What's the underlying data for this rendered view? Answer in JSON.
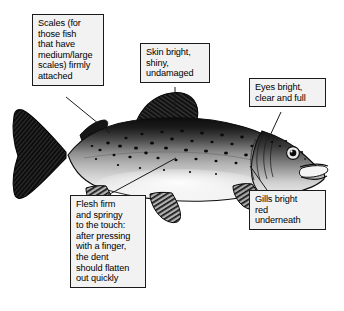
{
  "figure": {
    "background_color": "#ffffff",
    "box_fill_color": "#f2f2f2",
    "box_border_color": "#1a1a1a",
    "leader_line_color": "#1a1a1a"
  },
  "callouts": [
    {
      "id": "scales",
      "text": "Scales (for\nthose fish\nthat have\nmedium/large\nscales) firmly\nattached",
      "points_to": "scales-on-back"
    },
    {
      "id": "skin",
      "text": "Skin bright,\nshiny,\nundamaged",
      "points_to": "dorsal-fin-skin"
    },
    {
      "id": "eyes",
      "text": "Eyes bright,\nclear and full",
      "points_to": "eye"
    },
    {
      "id": "flesh",
      "text": "Flesh firm\nand springy\nto the touch:\nafter pressing\nwith a finger,\nthe dent\nshould flatten\nout quickly",
      "points_to": "flank-flesh"
    },
    {
      "id": "gills",
      "text": "Gills bright\nred\nunderneath",
      "points_to": "gill-cover"
    }
  ],
  "fish_parts": [
    {
      "name": "tail-fin",
      "label": "caudal fin"
    },
    {
      "name": "body",
      "label": "body"
    },
    {
      "name": "dorsal-fin",
      "label": "dorsal fin"
    },
    {
      "name": "adipose-fin",
      "label": "adipose fin"
    },
    {
      "name": "anal-fin",
      "label": "anal fin"
    },
    {
      "name": "pelvic-fin",
      "label": "pelvic fin"
    },
    {
      "name": "pectoral-fin",
      "label": "pectoral fin"
    },
    {
      "name": "head",
      "label": "head"
    },
    {
      "name": "eye",
      "label": "eye"
    },
    {
      "name": "mouth",
      "label": "mouth"
    },
    {
      "name": "gill-cover",
      "label": "gill cover"
    },
    {
      "name": "spots",
      "label": "dark spots"
    }
  ]
}
